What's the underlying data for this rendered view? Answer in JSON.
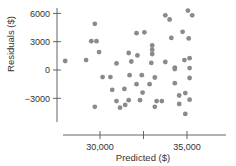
{
  "chart_data": {
    "type": "scatter",
    "title": "",
    "xlabel": "Predicted ($)",
    "ylabel": "Residuals ($)",
    "xlim": [
      27500,
      37300
    ],
    "ylim": [
      -5500,
      6500
    ],
    "x_ticks": [
      {
        "value": 30000,
        "label": "30,000"
      },
      {
        "value": 32500,
        "label": ""
      },
      {
        "value": 35000,
        "label": "35,000"
      }
    ],
    "y_ticks": [
      {
        "value": 6000,
        "label": "6000"
      },
      {
        "value": 3000,
        "label": "3000"
      },
      {
        "value": 0,
        "label": "0"
      },
      {
        "value": -3000,
        "label": "−3000"
      }
    ],
    "grid": false,
    "legend": null,
    "point_color": "#8a8a8a",
    "axis_color": "#555555",
    "points": [
      {
        "x": 28000,
        "y": 950
      },
      {
        "x": 29200,
        "y": 1050
      },
      {
        "x": 29700,
        "y": 4900
      },
      {
        "x": 29500,
        "y": 3050
      },
      {
        "x": 29800,
        "y": 3050
      },
      {
        "x": 29950,
        "y": 1900
      },
      {
        "x": 29700,
        "y": -3900
      },
      {
        "x": 30150,
        "y": -750
      },
      {
        "x": 30600,
        "y": -750
      },
      {
        "x": 30700,
        "y": -2100
      },
      {
        "x": 30950,
        "y": -3300
      },
      {
        "x": 31150,
        "y": -4000
      },
      {
        "x": 30950,
        "y": 700
      },
      {
        "x": 31800,
        "y": 900
      },
      {
        "x": 31700,
        "y": -550
      },
      {
        "x": 31400,
        "y": -2000
      },
      {
        "x": 31450,
        "y": -3700
      },
      {
        "x": 31650,
        "y": -3200
      },
      {
        "x": 31650,
        "y": 1800
      },
      {
        "x": 32150,
        "y": 1550
      },
      {
        "x": 32100,
        "y": 3900
      },
      {
        "x": 32550,
        "y": 4000
      },
      {
        "x": 32400,
        "y": -550
      },
      {
        "x": 32100,
        "y": -1500
      },
      {
        "x": 32300,
        "y": -3200
      },
      {
        "x": 32450,
        "y": -2400
      },
      {
        "x": 32850,
        "y": -1500
      },
      {
        "x": 32950,
        "y": 750
      },
      {
        "x": 33000,
        "y": 2600
      },
      {
        "x": 33000,
        "y": 2150
      },
      {
        "x": 33000,
        "y": 1700
      },
      {
        "x": 33150,
        "y": -3900
      },
      {
        "x": 33150,
        "y": -800
      },
      {
        "x": 33250,
        "y": -3300
      },
      {
        "x": 33550,
        "y": -3300
      },
      {
        "x": 33750,
        "y": 5800
      },
      {
        "x": 33750,
        "y": 850
      },
      {
        "x": 34000,
        "y": 5350
      },
      {
        "x": 34300,
        "y": -1400
      },
      {
        "x": 34550,
        "y": -2700
      },
      {
        "x": 34550,
        "y": -3600
      },
      {
        "x": 34300,
        "y": 250
      },
      {
        "x": 34300,
        "y": 100
      },
      {
        "x": 34100,
        "y": 3400
      },
      {
        "x": 34750,
        "y": 4050
      },
      {
        "x": 35050,
        "y": 6300
      },
      {
        "x": 35300,
        "y": 5800
      },
      {
        "x": 34850,
        "y": 1050
      },
      {
        "x": 35150,
        "y": 1250
      },
      {
        "x": 35100,
        "y": 3350
      },
      {
        "x": 35150,
        "y": 200
      },
      {
        "x": 35150,
        "y": -850
      },
      {
        "x": 34900,
        "y": -2450
      },
      {
        "x": 35150,
        "y": -3150
      },
      {
        "x": 34900,
        "y": -4650
      }
    ]
  }
}
